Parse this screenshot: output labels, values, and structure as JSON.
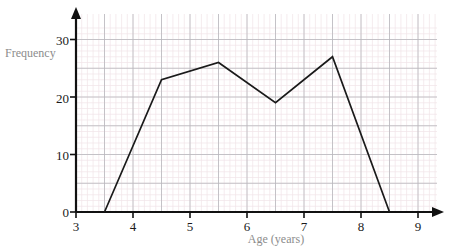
{
  "chart_data": {
    "type": "line",
    "title": "",
    "xlabel": "Age (years)",
    "ylabel": "Frequency",
    "xlim": [
      3,
      9.3
    ],
    "ylim": [
      0,
      32
    ],
    "xticks": [
      "3",
      "4",
      "5",
      "6",
      "7",
      "8",
      "9"
    ],
    "xtick_values": [
      3,
      4,
      5,
      6,
      7,
      8,
      9
    ],
    "yticks": [
      "0",
      "10",
      "20",
      "30"
    ],
    "ytick_values": [
      0,
      10,
      20,
      30
    ],
    "grid": true,
    "grid_major_step_x": 0.5,
    "grid_minor_step_x": 0.1,
    "grid_major_step_y": 5,
    "grid_minor_step_y": 1,
    "legend": null,
    "series": [
      {
        "name": "Frequency polygon",
        "x": [
          3.5,
          4.5,
          5.5,
          6.5,
          7.5,
          8.5
        ],
        "values": [
          0,
          23,
          26,
          19,
          27,
          0
        ],
        "color": "#1a1a1a"
      }
    ],
    "colors": {
      "line": "#1a1a1a",
      "axis": "#111111",
      "grid_major": "#b8b8bc",
      "grid_minor": "#f0e4e8",
      "tick_label": "#1a1a1a",
      "axis_title": "#8c8c8c",
      "background": "#ffffff"
    }
  },
  "labels": {
    "y_axis_title": "Frequency",
    "x_axis_title": "Age (years)",
    "y_tick_0": "0",
    "y_tick_10": "10",
    "y_tick_20": "20",
    "y_tick_30": "30",
    "x_tick_3": "3",
    "x_tick_4": "4",
    "x_tick_5": "5",
    "x_tick_6": "6",
    "x_tick_7": "7",
    "x_tick_8": "8",
    "x_tick_9": "9"
  }
}
